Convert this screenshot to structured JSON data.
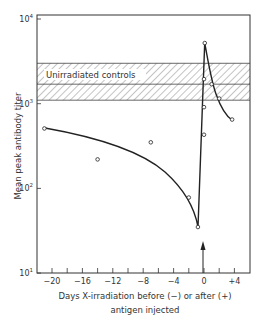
{
  "chart_data": {
    "type": "line",
    "title": "",
    "xlabel": "Days X-irradiation before (−) or after (+) antigen injected",
    "xlabel_lines": [
      "Days X-irradiation before (−) or after (+)",
      "antigen injected"
    ],
    "ylabel": "Mean peak antibody titer",
    "yscale": "log",
    "ylim": [
      10,
      10000
    ],
    "xlim": [
      -22,
      6
    ],
    "x_ticks": [
      -20,
      -18,
      -16,
      -14,
      -12,
      -10,
      -8,
      -6,
      -4,
      -2,
      0,
      2,
      4
    ],
    "x_tick_labels": [
      {
        "value": -20,
        "label": "−20"
      },
      {
        "value": -16,
        "label": "−16"
      },
      {
        "value": -12,
        "label": "−12"
      },
      {
        "value": -8,
        "label": "−8"
      },
      {
        "value": -4,
        "label": "−4"
      },
      {
        "value": 0,
        "label": "0"
      },
      {
        "value": 4,
        "label": "+4"
      }
    ],
    "y_tick_labels": [
      {
        "value": 10,
        "base": "10",
        "exp": "1"
      },
      {
        "value": 100,
        "base": "10",
        "exp": "2"
      },
      {
        "value": 1000,
        "base": "10",
        "exp": "3"
      },
      {
        "value": 10000,
        "base": "10",
        "exp": "4"
      }
    ],
    "grid": false,
    "series": [
      {
        "name": "Irradiated",
        "points": [
          {
            "x": -21,
            "y": 510
          },
          {
            "x": -14,
            "y": 220
          },
          {
            "x": -7,
            "y": 350
          },
          {
            "x": -2,
            "y": 78
          },
          {
            "x": -0.8,
            "y": 35
          },
          {
            "x": 0,
            "y": 430
          },
          {
            "x": 0,
            "y": 910
          },
          {
            "x": 0,
            "y": 1950
          },
          {
            "x": 0.1,
            "y": 5200
          },
          {
            "x": 1,
            "y": 1700
          },
          {
            "x": 2,
            "y": 1150
          },
          {
            "x": 3.7,
            "y": 650
          }
        ],
        "fitted_curve": true
      }
    ],
    "reference_band": {
      "label": "Unirradiated controls",
      "y_low": 1100,
      "y_mid": 1700,
      "y_high": 3000,
      "style": "hatched"
    },
    "annotations": [
      {
        "type": "arrow",
        "x": 0,
        "direction": "up",
        "meaning": "antigen injection time"
      }
    ]
  }
}
